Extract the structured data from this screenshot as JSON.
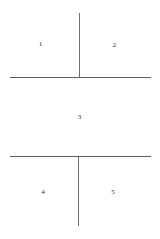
{
  "diagram": {
    "type": "panel-layout",
    "background_color": "#ffffff",
    "line_color": "#6e6e72",
    "label_color": "#2c2c2e",
    "frame": {
      "x": 10,
      "y": 13,
      "width": 141,
      "height": 213
    },
    "rows": [
      {
        "row_index": 1,
        "panels": [
          {
            "label": "1"
          },
          {
            "label": "2"
          }
        ]
      },
      {
        "row_index": 2,
        "panels": [
          {
            "label": "3"
          }
        ]
      },
      {
        "row_index": 3,
        "panels": [
          {
            "label": "4"
          },
          {
            "label": "5"
          }
        ]
      }
    ]
  }
}
